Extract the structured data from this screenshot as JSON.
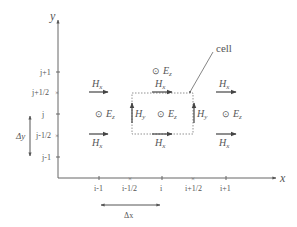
{
  "diagram": {
    "axes": {
      "x_label": "x",
      "y_label": "y",
      "x_ticks": [
        {
          "label": "i-1",
          "marker": "tick",
          "x": 99
        },
        {
          "label": "i-1/2",
          "marker": "cross",
          "x": 131
        },
        {
          "label": "i",
          "marker": "tick",
          "x": 162
        },
        {
          "label": "i+1/2",
          "marker": "cross",
          "x": 194
        },
        {
          "label": "i+1",
          "marker": "tick",
          "x": 226
        }
      ],
      "y_ticks": [
        {
          "label": "j+1",
          "marker": "tick",
          "y": 72
        },
        {
          "label": "j+1/2",
          "marker": "cross",
          "y": 92
        },
        {
          "label": "j",
          "marker": "tick",
          "y": 114
        },
        {
          "label": "j-1/2",
          "marker": "cross",
          "y": 135
        },
        {
          "label": "j-1",
          "marker": "tick",
          "y": 157
        }
      ]
    },
    "dimensions": {
      "dx_label": "Δx",
      "dy_label": "Δy"
    },
    "annotation": {
      "cell_label": "cell"
    },
    "fields": {
      "hx": "H",
      "hx_sub": "x",
      "hy": "H",
      "hy_sub": "y",
      "ez": "E",
      "ez_sub": "z",
      "ez_symbol": "⊙"
    },
    "colors": {
      "line": "#555555",
      "arrow": "#444444",
      "dotted": "#777777"
    }
  }
}
